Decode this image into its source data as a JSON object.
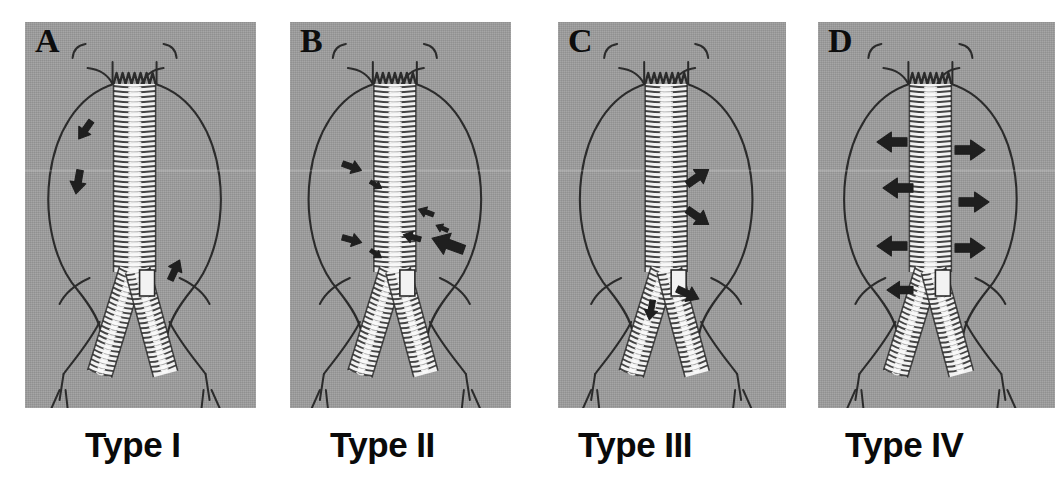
{
  "figure": {
    "background_color": "#ffffff",
    "panel_background_color": "#9c9c9c",
    "ink_color": "#2b2b2b",
    "graft_color": "#f2f2f2",
    "panels": [
      {
        "letter": "A",
        "caption": "Type I",
        "x": 25,
        "y": 22,
        "width": 231,
        "height": 386,
        "leak_description": "attachment-site leak at proximal graft seal with flow into aneurysm sac",
        "arrows": [
          {
            "name": "proximal-attachment-leak-arrow",
            "x": 60,
            "y": 108,
            "angle": 125,
            "size": 22
          },
          {
            "name": "sac-flow-arrow",
            "x": 53,
            "y": 160,
            "angle": 100,
            "size": 24
          },
          {
            "name": "distal-attachment-leak-arrow",
            "x": 150,
            "y": 248,
            "angle": -65,
            "size": 22
          }
        ]
      },
      {
        "letter": "B",
        "caption": "Type II",
        "x": 290,
        "y": 22,
        "width": 221,
        "height": 386,
        "leak_description": "retrograde branch-vessel flow from lumbar and inferior mesenteric arteries",
        "arrows": [
          {
            "name": "lumbar-branch-arrow-upper-left",
            "x": 62,
            "y": 145,
            "angle": 20,
            "size": 20
          },
          {
            "name": "lumbar-branch-arrow-upper-left-small",
            "x": 86,
            "y": 163,
            "angle": 30,
            "size": 13
          },
          {
            "name": "lumbar-branch-arrow-lower-left",
            "x": 62,
            "y": 218,
            "angle": 15,
            "size": 20
          },
          {
            "name": "lumbar-branch-arrow-lower-left-small",
            "x": 86,
            "y": 232,
            "angle": 35,
            "size": 13
          },
          {
            "name": "lumbar-branch-arrow-upper-right",
            "x": 136,
            "y": 190,
            "angle": 200,
            "size": 16
          },
          {
            "name": "lumbar-branch-arrow-mid-right",
            "x": 122,
            "y": 215,
            "angle": 195,
            "size": 18
          },
          {
            "name": "lumbar-branch-arrow-right-small",
            "x": 152,
            "y": 206,
            "angle": 205,
            "size": 13
          },
          {
            "name": "inferior-mesenteric-artery-arrow",
            "x": 158,
            "y": 222,
            "angle": 200,
            "size": 34
          }
        ]
      },
      {
        "letter": "C",
        "caption": "Type III",
        "x": 558,
        "y": 22,
        "width": 228,
        "height": 386,
        "leak_description": "graft fabric tear or modular component disconnection",
        "arrows": [
          {
            "name": "fabric-defect-arrow-upper",
            "x": 140,
            "y": 155,
            "angle": -35,
            "size": 26
          },
          {
            "name": "fabric-defect-arrow-lower",
            "x": 140,
            "y": 195,
            "angle": 35,
            "size": 26
          },
          {
            "name": "modular-disconnection-arrow",
            "x": 130,
            "y": 272,
            "angle": 25,
            "size": 24
          },
          {
            "name": "limb-junction-arrow",
            "x": 93,
            "y": 288,
            "angle": 100,
            "size": 20
          }
        ]
      },
      {
        "letter": "D",
        "caption": "Type IV",
        "x": 818,
        "y": 22,
        "width": 237,
        "height": 386,
        "leak_description": "graft wall porosity with diffuse transmural seepage",
        "arrows": [
          {
            "name": "porosity-arrow-left-1",
            "x": 74,
            "y": 120,
            "angle": 180,
            "size": 30
          },
          {
            "name": "porosity-arrow-left-2",
            "x": 80,
            "y": 166,
            "angle": 180,
            "size": 30
          },
          {
            "name": "porosity-arrow-left-3",
            "x": 74,
            "y": 224,
            "angle": 180,
            "size": 30
          },
          {
            "name": "porosity-arrow-left-4",
            "x": 82,
            "y": 268,
            "angle": 180,
            "size": 26
          },
          {
            "name": "porosity-arrow-right-1",
            "x": 152,
            "y": 128,
            "angle": 0,
            "size": 30
          },
          {
            "name": "porosity-arrow-right-2",
            "x": 156,
            "y": 180,
            "angle": 0,
            "size": 30
          },
          {
            "name": "porosity-arrow-right-3",
            "x": 152,
            "y": 226,
            "angle": 0,
            "size": 30
          }
        ]
      }
    ],
    "captions": [
      {
        "text": "Type I",
        "x": 85,
        "y": 425
      },
      {
        "text": "Type II",
        "x": 330,
        "y": 425
      },
      {
        "text": "Type III",
        "x": 578,
        "y": 425
      },
      {
        "text": "Type IV",
        "x": 845,
        "y": 425
      }
    ]
  }
}
